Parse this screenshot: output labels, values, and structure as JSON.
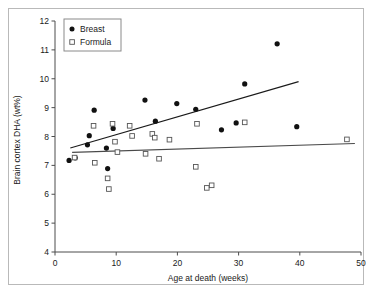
{
  "figure": {
    "background_color": "#ffffff",
    "frame_color": "#b9b9b9"
  },
  "chart_data": {
    "type": "scatter",
    "title": "",
    "xlabel": "Age at death (weeks)",
    "ylabel": "Brain cortex DHA (wt%)",
    "xlim": [
      0,
      50
    ],
    "ylim": [
      4,
      12
    ],
    "xticks": [
      0,
      10,
      20,
      30,
      40,
      50
    ],
    "yticks": [
      4,
      5,
      6,
      7,
      8,
      9,
      10,
      11,
      12
    ],
    "grid": false,
    "legend_position": "top-left",
    "series": [
      {
        "name": "Breast",
        "marker": "filled-circle",
        "color": "#111111",
        "points": [
          [
            2.3,
            7.17
          ],
          [
            3.3,
            7.26
          ],
          [
            5.3,
            7.71
          ],
          [
            5.6,
            8.03
          ],
          [
            6.4,
            8.91
          ],
          [
            8.4,
            7.6
          ],
          [
            8.6,
            6.89
          ],
          [
            9.5,
            8.28
          ],
          [
            14.7,
            9.26
          ],
          [
            16.4,
            8.53
          ],
          [
            19.9,
            9.14
          ],
          [
            23.0,
            8.94
          ],
          [
            27.2,
            8.23
          ],
          [
            29.6,
            8.47
          ],
          [
            31.0,
            9.82
          ],
          [
            36.3,
            11.21
          ],
          [
            39.5,
            8.34
          ]
        ],
        "trendline": {
          "x1": 2.5,
          "y1": 7.6,
          "x2": 39.8,
          "y2": 9.9
        }
      },
      {
        "name": "Formula",
        "marker": "open-square",
        "color": "#555555",
        "points": [
          [
            3.2,
            7.27
          ],
          [
            6.3,
            8.37
          ],
          [
            6.5,
            7.09
          ],
          [
            8.6,
            6.55
          ],
          [
            8.8,
            6.18
          ],
          [
            9.4,
            8.44
          ],
          [
            9.8,
            7.82
          ],
          [
            10.2,
            7.46
          ],
          [
            12.2,
            8.37
          ],
          [
            12.6,
            8.02
          ],
          [
            14.8,
            7.4
          ],
          [
            15.9,
            8.09
          ],
          [
            16.3,
            7.96
          ],
          [
            17.0,
            7.23
          ],
          [
            18.7,
            7.89
          ],
          [
            23.0,
            6.95
          ],
          [
            23.2,
            8.44
          ],
          [
            24.8,
            6.22
          ],
          [
            25.6,
            6.31
          ],
          [
            31.0,
            8.49
          ],
          [
            47.7,
            7.9
          ]
        ],
        "trendline": {
          "x1": 2.8,
          "y1": 7.45,
          "x2": 49.0,
          "y2": 7.76
        }
      }
    ]
  },
  "legend": {
    "items": [
      {
        "label": "Breast",
        "marker": "filled-circle"
      },
      {
        "label": "Formula",
        "marker": "open-square"
      }
    ]
  },
  "axis_labels": {
    "x_ticks": [
      "0",
      "10",
      "20",
      "30",
      "40",
      "50"
    ],
    "y_ticks": [
      "4",
      "5",
      "6",
      "7",
      "8",
      "9",
      "10",
      "11",
      "12"
    ],
    "x_title": "Age at death (weeks)",
    "y_title": "Brain cortex DHA (wt%)"
  }
}
